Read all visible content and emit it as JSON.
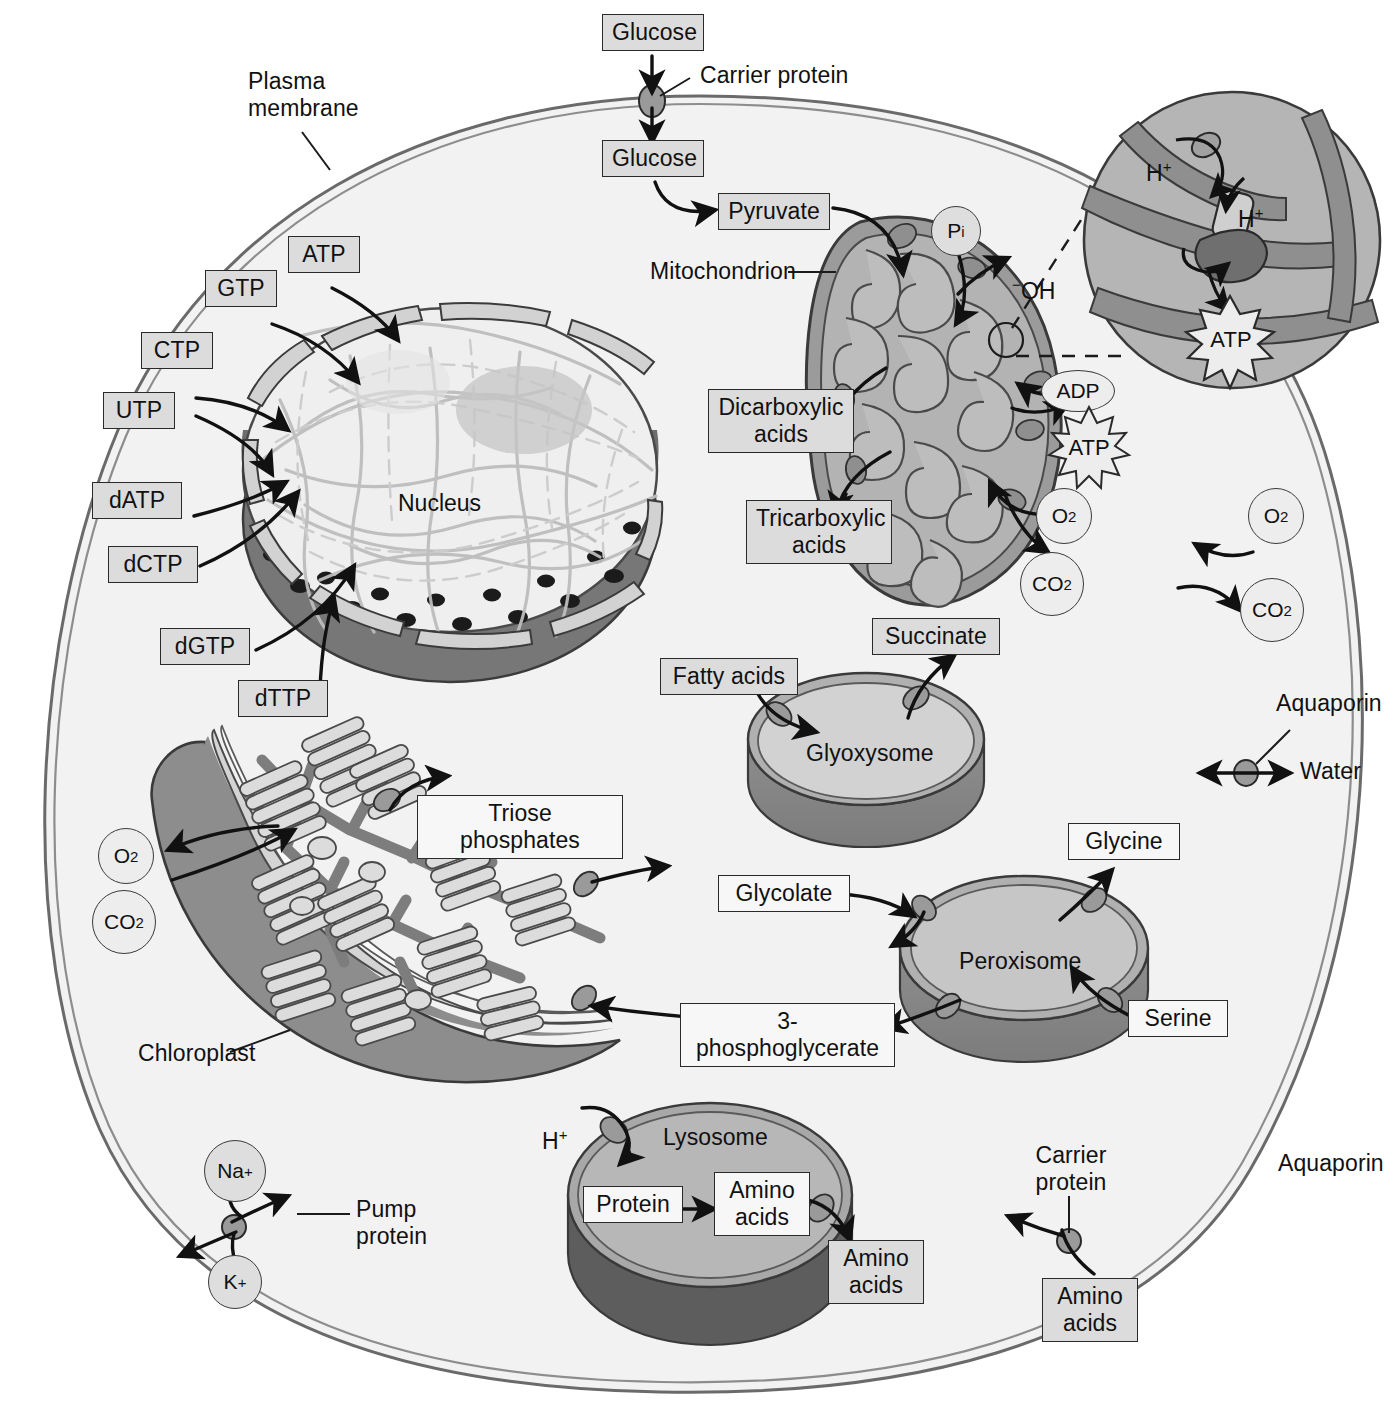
{
  "diagram": {
    "type": "cell-biology-schematic",
    "colors": {
      "label_box_fill": "#dcdcdc",
      "label_box_stroke": "#2a2a2a",
      "cytosol_fill": "#f2f2f2",
      "membrane_stroke": "#555555",
      "organelle_mid": "#b8b8b8",
      "organelle_dark": "#8a8a8a",
      "nuclear_envelope_dark": "#6e6e6e",
      "arrow_color": "#111111"
    }
  },
  "annotations": {
    "plasma_membrane": "Plasma\nmembrane",
    "carrier_protein_top": "Carrier protein",
    "mitochondrion": "Mitochondrion",
    "nucleus": "Nucleus",
    "chloroplast": "Chloroplast",
    "glyoxysome": "Glyoxysome",
    "peroxisome": "Peroxisome",
    "lysosome": "Lysosome",
    "aquaporin": "Aquaporin",
    "water": "Water",
    "pump_protein": "Pump\nprotein",
    "carrier_protein_bottom": "Carrier\nprotein",
    "hydroxide": "OH",
    "hydroxide_charge": "−",
    "proton": "H",
    "proton_charge": "+"
  },
  "metabolite_boxes": [
    {
      "id": "glucose-extracellular",
      "label": "Glucose"
    },
    {
      "id": "glucose-cytosolic",
      "label": "Glucose"
    },
    {
      "id": "pyruvate",
      "label": "Pyruvate"
    },
    {
      "id": "atp-nuclear",
      "label": "ATP"
    },
    {
      "id": "gtp",
      "label": "GTP"
    },
    {
      "id": "ctp",
      "label": "CTP"
    },
    {
      "id": "utp",
      "label": "UTP"
    },
    {
      "id": "datp",
      "label": "dATP"
    },
    {
      "id": "dctp",
      "label": "dCTP"
    },
    {
      "id": "dgtp",
      "label": "dGTP"
    },
    {
      "id": "dttp",
      "label": "dTTP"
    },
    {
      "id": "dicarboxylic-acids",
      "label": "Dicarboxylic\nacids"
    },
    {
      "id": "tricarboxylic-acids",
      "label": "Tricarboxylic\nacids"
    },
    {
      "id": "fatty-acids",
      "label": "Fatty acids"
    },
    {
      "id": "succinate",
      "label": "Succinate"
    },
    {
      "id": "triose-phosphates",
      "label": "Triose phosphates"
    },
    {
      "id": "glycolate",
      "label": "Glycolate"
    },
    {
      "id": "glycine",
      "label": "Glycine"
    },
    {
      "id": "serine",
      "label": "Serine"
    },
    {
      "id": "three-phosphoglycerate",
      "label": "3-phosphoglycerate"
    },
    {
      "id": "protein",
      "label": "Protein"
    },
    {
      "id": "amino-acids-lysosome",
      "label": "Amino\nacids"
    },
    {
      "id": "amino-acids-cytosol",
      "label": "Amino\nacids"
    },
    {
      "id": "amino-acids-extracellular",
      "label": "Amino\nacids"
    }
  ],
  "molecule_tokens": [
    {
      "id": "pi",
      "label": "P",
      "sub": "i",
      "shape": "circle"
    },
    {
      "id": "adp",
      "label": "ADP",
      "shape": "ellipse"
    },
    {
      "id": "atp-mitochondrial",
      "label": "ATP",
      "shape": "burst"
    },
    {
      "id": "atp-inset",
      "label": "ATP",
      "shape": "burst"
    },
    {
      "id": "o2-mitochondrial",
      "label": "O",
      "sub": "2",
      "shape": "circle"
    },
    {
      "id": "co2-mitochondrial",
      "label": "CO",
      "sub": "2",
      "shape": "circle"
    },
    {
      "id": "o2-extracellular",
      "label": "O",
      "sub": "2",
      "shape": "circle"
    },
    {
      "id": "co2-extracellular",
      "label": "CO",
      "sub": "2",
      "shape": "circle"
    },
    {
      "id": "o2-chloroplast",
      "label": "O",
      "sub": "2",
      "shape": "circle"
    },
    {
      "id": "co2-chloroplast",
      "label": "CO",
      "sub": "2",
      "shape": "circle"
    },
    {
      "id": "sodium-ion",
      "label": "Na",
      "sup": "+",
      "shape": "circle"
    },
    {
      "id": "potassium-ion",
      "label": "K",
      "sup": "+",
      "shape": "circle"
    }
  ],
  "inset": {
    "title": "ATP synthase detail",
    "proton_upper": "H",
    "proton_upper_charge": "+",
    "proton_lower": "H",
    "proton_lower_charge": "+",
    "atp": "ATP"
  },
  "transport_events": [
    {
      "from": "Glucose",
      "to": "Glucose",
      "via": "Carrier protein",
      "across": "plasma membrane"
    },
    {
      "from": "Glucose",
      "to": "Pyruvate",
      "via": "glycolysis",
      "across": "cytosol"
    },
    {
      "from": "Pyruvate",
      "to": "mitochondrial matrix",
      "via": "carrier",
      "across": "mitochondrial membrane"
    },
    {
      "from": "Pi",
      "to": "mitochondrial matrix",
      "exchange": "OH−",
      "across": "mitochondrial membrane"
    },
    {
      "from": "mitochondrion",
      "to": "Dicarboxylic acids",
      "across": "mitochondrial membrane"
    },
    {
      "from": "mitochondrion",
      "to": "Tricarboxylic acids",
      "across": "mitochondrial membrane"
    },
    {
      "from": "ADP",
      "to": "ATP",
      "across": "mitochondrial membrane"
    },
    {
      "from": "O2",
      "to": "mitochondrion",
      "across": "mitochondrial membrane"
    },
    {
      "from": "mitochondrion",
      "to": "CO2",
      "across": "mitochondrial membrane"
    },
    {
      "from": "Fatty acids",
      "to": "Glyoxysome",
      "across": "glyoxysomal membrane"
    },
    {
      "from": "Glyoxysome",
      "to": "Succinate",
      "across": "glyoxysomal membrane"
    },
    {
      "from": "Chloroplast",
      "to": "Triose phosphates",
      "across": "chloroplast envelope"
    },
    {
      "from": "Chloroplast",
      "to": "Glycolate",
      "across": "chloroplast envelope"
    },
    {
      "from": "Glycolate",
      "to": "Peroxisome",
      "across": "peroxisomal membrane"
    },
    {
      "from": "Peroxisome",
      "to": "Glycine",
      "across": "peroxisomal membrane"
    },
    {
      "from": "Serine",
      "to": "Peroxisome",
      "across": "peroxisomal membrane"
    },
    {
      "from": "Peroxisome",
      "to": "3-phosphoglycerate",
      "across": "peroxisomal membrane"
    },
    {
      "from": "3-phosphoglycerate",
      "to": "Chloroplast",
      "across": "chloroplast envelope"
    },
    {
      "from": "Chloroplast",
      "to": "O2",
      "across": "chloroplast envelope"
    },
    {
      "from": "CO2",
      "to": "Chloroplast",
      "across": "chloroplast envelope"
    },
    {
      "from": "H+",
      "to": "Lysosome",
      "across": "lysosomal membrane"
    },
    {
      "from": "Protein",
      "to": "Amino acids",
      "across": "lysosomal lumen"
    },
    {
      "from": "Amino acids",
      "to": "cytosol",
      "across": "lysosomal membrane"
    },
    {
      "from": "Amino acids",
      "to": "cytosol",
      "via": "Carrier protein",
      "across": "plasma membrane"
    },
    {
      "from": "Na+ / K+",
      "to": "exchange",
      "via": "Pump protein",
      "across": "plasma membrane"
    },
    {
      "from": "Water",
      "to": "bidirectional",
      "via": "Aquaporin",
      "across": "plasma membrane"
    },
    {
      "from": "O2",
      "to": "cytosol",
      "across": "plasma membrane"
    },
    {
      "from": "CO2",
      "to": "extracellular",
      "across": "plasma membrane"
    },
    {
      "from": "ATP/GTP/CTP/UTP/dATP/dCTP/dGTP/dTTP",
      "to": "Nucleus",
      "across": "nuclear pores"
    }
  ]
}
